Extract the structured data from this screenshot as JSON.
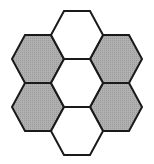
{
  "diagram": {
    "type": "hexagon-arrangement",
    "width": 154,
    "height": 164,
    "hex_half_width": 26,
    "hex_half_height": 24,
    "hex_top_half_width": 13,
    "stroke_color": "#1a1a1a",
    "stroke_width": 2,
    "shaded_fill": "#a8a8a8",
    "empty_fill": "#ffffff",
    "cells": [
      {
        "id": "top-center",
        "cx": 77,
        "cy": 35,
        "shaded": false
      },
      {
        "id": "middle-center",
        "cx": 77,
        "cy": 83,
        "shaded": false
      },
      {
        "id": "bottom-center",
        "cx": 77,
        "cy": 131,
        "shaded": false
      },
      {
        "id": "upper-left",
        "cx": 38,
        "cy": 59,
        "shaded": true
      },
      {
        "id": "lower-left",
        "cx": 38,
        "cy": 107,
        "shaded": true
      },
      {
        "id": "upper-right",
        "cx": 116,
        "cy": 59,
        "shaded": true
      },
      {
        "id": "lower-right",
        "cx": 116,
        "cy": 107,
        "shaded": true
      }
    ]
  }
}
